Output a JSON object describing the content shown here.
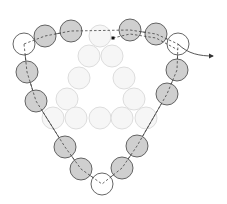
{
  "diagram": {
    "colors": {
      "bead_gray": "#cfcfcf",
      "bead_white": "#ffffff",
      "bead_stroke": "#555555",
      "faded_fill": "#f6f6f6",
      "faded_stroke": "#dddddd",
      "thread": "#444444"
    },
    "radius": 11,
    "chain_beads": [
      {
        "x": 24,
        "y": 44,
        "fill": "white"
      },
      {
        "x": 45,
        "y": 36,
        "fill": "gray"
      },
      {
        "x": 71,
        "y": 31,
        "fill": "gray"
      },
      {
        "x": 130,
        "y": 30,
        "fill": "gray"
      },
      {
        "x": 156,
        "y": 34,
        "fill": "gray"
      },
      {
        "x": 178,
        "y": 44,
        "fill": "white"
      },
      {
        "x": 177,
        "y": 70,
        "fill": "gray"
      },
      {
        "x": 167,
        "y": 94,
        "fill": "gray"
      },
      {
        "x": 137,
        "y": 146,
        "fill": "gray"
      },
      {
        "x": 122,
        "y": 168,
        "fill": "gray"
      },
      {
        "x": 102,
        "y": 184,
        "fill": "white"
      },
      {
        "x": 81,
        "y": 169,
        "fill": "gray"
      },
      {
        "x": 65,
        "y": 147,
        "fill": "gray"
      },
      {
        "x": 36,
        "y": 101,
        "fill": "gray"
      },
      {
        "x": 27,
        "y": 72,
        "fill": "gray"
      }
    ],
    "faded_beads": [
      {
        "x": 100,
        "y": 36
      },
      {
        "x": 89,
        "y": 56
      },
      {
        "x": 112,
        "y": 56
      },
      {
        "x": 79,
        "y": 78
      },
      {
        "x": 124,
        "y": 78
      },
      {
        "x": 67,
        "y": 99
      },
      {
        "x": 134,
        "y": 99
      },
      {
        "x": 53,
        "y": 118
      },
      {
        "x": 76,
        "y": 118
      },
      {
        "x": 100,
        "y": 118
      },
      {
        "x": 122,
        "y": 118
      },
      {
        "x": 146,
        "y": 118
      }
    ],
    "thread_start": {
      "x": 113,
      "y": 38
    },
    "arrow_end": {
      "x": 213,
      "y": 56
    }
  }
}
